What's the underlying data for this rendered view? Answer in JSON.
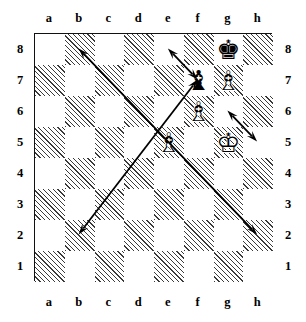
{
  "diagram": {
    "type": "chessboard",
    "orientation": "white-bottom",
    "board": {
      "files": [
        "a",
        "b",
        "c",
        "d",
        "e",
        "f",
        "g",
        "h"
      ],
      "ranks": [
        "8",
        "7",
        "6",
        "5",
        "4",
        "3",
        "2",
        "1"
      ],
      "light_square_color": "#ffffff",
      "dark_square_color": "#3a3a3a",
      "dark_square_style": "diagonal-hatch",
      "border_color": "#111111"
    },
    "labels": {
      "files_top": [
        "a",
        "b",
        "c",
        "d",
        "e",
        "f",
        "g",
        "h"
      ],
      "files_bottom": [
        "a",
        "b",
        "c",
        "d",
        "e",
        "f",
        "g",
        "h"
      ],
      "ranks_left": [
        "8",
        "7",
        "6",
        "5",
        "4",
        "3",
        "2",
        "1"
      ],
      "ranks_right": [
        "8",
        "7",
        "6",
        "5",
        "4",
        "3",
        "2",
        "1"
      ]
    },
    "pieces": [
      {
        "square": "g8",
        "color": "black",
        "type": "king",
        "glyph": "♚",
        "name": "black-king-g8"
      },
      {
        "square": "f7",
        "color": "black",
        "type": "bishop",
        "glyph": "♝",
        "name": "black-bishop-f7"
      },
      {
        "square": "g7",
        "color": "white",
        "type": "bishop",
        "glyph": "♗",
        "name": "white-bishop-g7"
      },
      {
        "square": "f6",
        "color": "white",
        "type": "bishop",
        "glyph": "♗",
        "name": "white-bishop-f6"
      },
      {
        "square": "e5",
        "color": "white",
        "type": "bishop",
        "glyph": "♗",
        "name": "white-bishop-e5"
      },
      {
        "square": "g5",
        "color": "white",
        "type": "king",
        "glyph": "♔",
        "name": "white-king-g5"
      }
    ],
    "arrows": [
      {
        "name": "arrow-h2-b8",
        "from": "h2",
        "to": "b8",
        "double_headed": true,
        "color": "#000000"
      },
      {
        "name": "arrow-b2-f7",
        "from": "b2",
        "to": "f7",
        "double_headed": true,
        "color": "#000000"
      },
      {
        "name": "arrow-e8-f7",
        "from": "e8",
        "to": "f7",
        "double_headed": true,
        "color": "#000000"
      },
      {
        "name": "arrow-g6-h5",
        "from": "g6",
        "to": "h5",
        "double_headed": true,
        "color": "#000000"
      }
    ]
  }
}
